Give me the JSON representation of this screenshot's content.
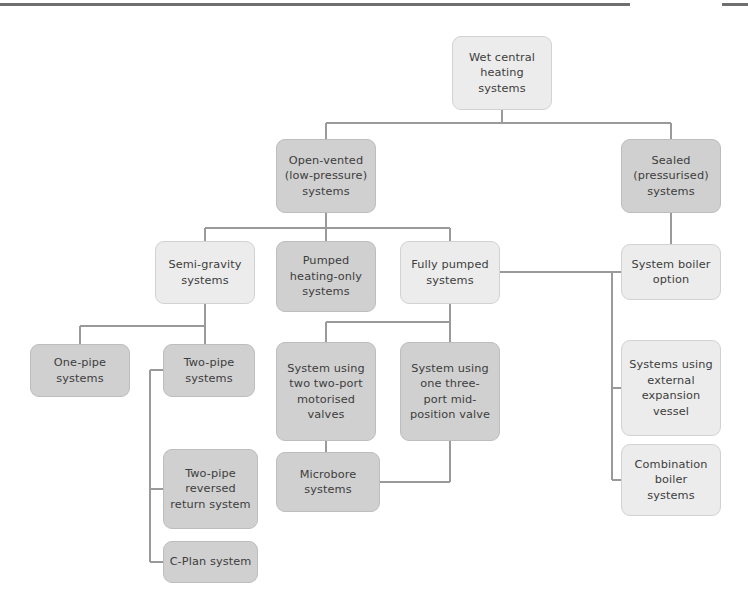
{
  "page": {
    "background": "#ffffff",
    "top_rule_color": "#6f6f6f",
    "tone_light": "#ececec",
    "tone_dark": "#d0d0d0",
    "text_color": "#3d3d3d",
    "connector_color": "#9a9a9a"
  },
  "nodes": {
    "root": {
      "label": "Wet central\nheating\nsystems",
      "tone": "light"
    },
    "open_vented": {
      "label": "Open-vented\n(low-pressure)\nsystems",
      "tone": "dark"
    },
    "sealed": {
      "label": "Sealed\n(pressurised)\nsystems",
      "tone": "dark"
    },
    "semi_gravity": {
      "label": "Semi-gravity\nsystems",
      "tone": "light"
    },
    "pumped_heating_only": {
      "label": "Pumped\nheating-only\nsystems",
      "tone": "dark"
    },
    "fully_pumped": {
      "label": "Fully pumped\nsystems",
      "tone": "light"
    },
    "system_boiler": {
      "label": "System boiler\noption",
      "tone": "light"
    },
    "one_pipe": {
      "label": "One-pipe\nsystems",
      "tone": "dark"
    },
    "two_pipe": {
      "label": "Two-pipe\nsystems",
      "tone": "dark"
    },
    "two_port": {
      "label": "System using\ntwo two-port\nmotorised\nvalves",
      "tone": "dark"
    },
    "three_port": {
      "label": "System using\none three-\nport mid-\nposition valve",
      "tone": "dark"
    },
    "ext_expansion": {
      "label": "Systems using\nexternal\nexpansion\nvessel",
      "tone": "light"
    },
    "microbore": {
      "label": "Microbore\nsystems",
      "tone": "dark"
    },
    "combination": {
      "label": "Combination\nboiler\nsystems",
      "tone": "light"
    },
    "reversed_return": {
      "label": "Two-pipe\nreversed\nreturn system",
      "tone": "dark"
    },
    "c_plan": {
      "label": "C-Plan system",
      "tone": "dark"
    }
  },
  "hierarchy": [
    {
      "parent": "root",
      "children": [
        "open_vented",
        "sealed"
      ]
    },
    {
      "parent": "open_vented",
      "children": [
        "semi_gravity",
        "pumped_heating_only",
        "fully_pumped"
      ]
    },
    {
      "parent": "sealed",
      "children": [
        "system_boiler"
      ]
    },
    {
      "parent": "semi_gravity",
      "children": [
        "one_pipe",
        "two_pipe"
      ]
    },
    {
      "parent": "two_pipe",
      "children": [
        "reversed_return",
        "c_plan"
      ]
    },
    {
      "parent": "fully_pumped",
      "children": [
        "two_port",
        "three_port",
        "system_boiler",
        "ext_expansion",
        "combination"
      ]
    },
    {
      "parent": "two_port",
      "children": [
        "microbore"
      ]
    },
    {
      "parent": "three_port",
      "children": [
        "microbore"
      ]
    }
  ]
}
